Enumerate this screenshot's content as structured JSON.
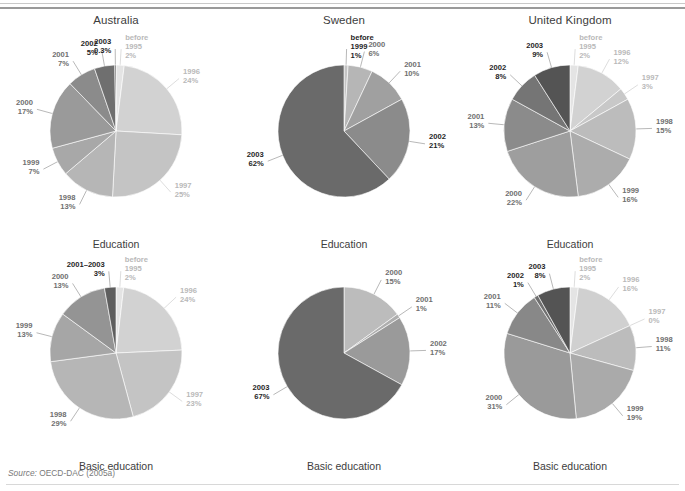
{
  "figure": {
    "source_prefix": "Source:",
    "source_text": "OECD-DAC (2005a)"
  },
  "columns": [
    {
      "title": "Australia"
    },
    {
      "title": "Sweden"
    },
    {
      "title": "United Kingdom"
    }
  ],
  "rows": [
    {
      "caption": "Education"
    },
    {
      "caption": "Basic education"
    }
  ],
  "palette": {
    "before1995": "#e4e4e4",
    "y1996": "#d2d2d2",
    "y1997": "#c4c4c4",
    "y1998": "#b6b6b6",
    "y1999": "#a8a8a8",
    "y2000": "#9a9a9a",
    "y2001": "#8b8b8b",
    "y2002": "#6f6f6f",
    "y2003": "#4f4f4f",
    "combined": "#5e5e5e",
    "label_dark": "#1f1f1f",
    "label_mid": "#6f6f6f",
    "label_light": "#b9b9b9",
    "rule": "#9a9a9a",
    "page_bg": "#ffffff"
  },
  "chart_data": [
    {
      "type": "pie",
      "title": "Australia",
      "subtitle": "Education",
      "column": 0,
      "row": 0,
      "categories": [
        "before 1995",
        "1996",
        "1997",
        "1998",
        "1999",
        "2000",
        "2001",
        "2002",
        "2003"
      ],
      "values": [
        2,
        24,
        25,
        13,
        7,
        17,
        7,
        5,
        0.3
      ],
      "labels": [
        "2%",
        "24%",
        "25%",
        "13%",
        "7%",
        "17%",
        "7%",
        "5%",
        "0.3%"
      ],
      "colors": [
        "#e4e4e4",
        "#d2d2d2",
        "#c4c4c4",
        "#b6b6b6",
        "#a8a8a8",
        "#9a9a9a",
        "#8b8b8b",
        "#6f6f6f",
        "#4f4f4f"
      ],
      "label_tones": [
        "light",
        "light",
        "light",
        "mid",
        "mid",
        "mid",
        "mid",
        "dark",
        "dark"
      ],
      "unit": "%"
    },
    {
      "type": "pie",
      "title": "Sweden",
      "subtitle": "Education",
      "column": 1,
      "row": 0,
      "categories": [
        "before 1999",
        "2000",
        "2001",
        "2002",
        "2003"
      ],
      "values": [
        1,
        6,
        10,
        21,
        62
      ],
      "labels": [
        "1%",
        "6%",
        "10%",
        "21%",
        "62%"
      ],
      "colors": [
        "#c4c4c4",
        "#b6b6b6",
        "#a0a0a0",
        "#8b8b8b",
        "#6a6a6a"
      ],
      "label_tones": [
        "dark",
        "mid",
        "mid",
        "dark",
        "dark"
      ],
      "unit": "%"
    },
    {
      "type": "pie",
      "title": "United Kingdom",
      "subtitle": "Education",
      "column": 2,
      "row": 0,
      "categories": [
        "before 1995",
        "1996",
        "1997",
        "1998",
        "1999",
        "2000",
        "2001",
        "2002",
        "2003"
      ],
      "values": [
        2,
        12,
        3,
        15,
        16,
        22,
        13,
        8,
        9
      ],
      "labels": [
        "2%",
        "12%",
        "3%",
        "15%",
        "16%",
        "22%",
        "13%",
        "8%",
        "9%"
      ],
      "colors": [
        "#e4e4e4",
        "#d2d2d2",
        "#c8c8c8",
        "#bcbcbc",
        "#acacac",
        "#9e9e9e",
        "#8b8b8b",
        "#757575",
        "#545454"
      ],
      "label_tones": [
        "light",
        "light",
        "light",
        "mid",
        "mid",
        "mid",
        "mid",
        "dark",
        "dark"
      ],
      "unit": "%"
    },
    {
      "type": "pie",
      "title": "Australia",
      "subtitle": "Basic education",
      "column": 0,
      "row": 1,
      "categories": [
        "before 1995",
        "1996",
        "1997",
        "1998",
        "1999",
        "2000",
        "2001–2003"
      ],
      "values": [
        2,
        24,
        23,
        29,
        13,
        13,
        3
      ],
      "labels": [
        "2%",
        "24%",
        "23%",
        "29%",
        "13%",
        "13%",
        "3%"
      ],
      "colors": [
        "#e4e4e4",
        "#d2d2d2",
        "#c4c4c4",
        "#b6b6b6",
        "#a6a6a6",
        "#949494",
        "#5e5e5e"
      ],
      "label_tones": [
        "light",
        "light",
        "light",
        "mid",
        "mid",
        "mid",
        "dark"
      ],
      "unit": "%"
    },
    {
      "type": "pie",
      "title": "Sweden",
      "subtitle": "Basic education",
      "column": 1,
      "row": 1,
      "categories": [
        "2000",
        "2001",
        "2002",
        "2003"
      ],
      "values": [
        15,
        1,
        17,
        67
      ],
      "labels": [
        "15%",
        "1%",
        "17%",
        "67%"
      ],
      "colors": [
        "#bcbcbc",
        "#aeaeae",
        "#9a9a9a",
        "#6a6a6a"
      ],
      "label_tones": [
        "mid",
        "mid",
        "mid",
        "dark"
      ],
      "unit": "%"
    },
    {
      "type": "pie",
      "title": "United Kingdom",
      "subtitle": "Basic education",
      "column": 2,
      "row": 1,
      "categories": [
        "before 1995",
        "1996",
        "1997",
        "1998",
        "1999",
        "2000",
        "2001",
        "2002",
        "2003"
      ],
      "values": [
        2,
        16,
        0,
        11,
        19,
        31,
        11,
        1,
        8
      ],
      "labels": [
        "2%",
        "16%",
        "0%",
        "11%",
        "19%",
        "31%",
        "11%",
        "1%",
        "8%"
      ],
      "colors": [
        "#e4e4e4",
        "#d0d0d0",
        "#c8c8c8",
        "#bcbcbc",
        "#aaaaaa",
        "#9a9a9a",
        "#888888",
        "#6f6f6f",
        "#545454"
      ],
      "label_tones": [
        "light",
        "light",
        "light",
        "mid",
        "mid",
        "mid",
        "mid",
        "dark",
        "dark"
      ],
      "unit": "%"
    }
  ]
}
